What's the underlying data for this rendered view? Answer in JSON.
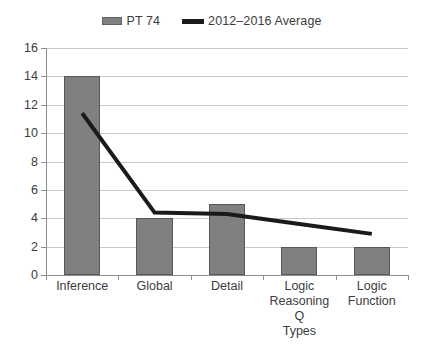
{
  "chart_data": {
    "type": "bar",
    "title": "",
    "subtitle": "",
    "xlabel": "",
    "ylabel": "",
    "categories": [
      "Inference",
      "Global",
      "Detail",
      "Logic Reasoning Q Types",
      "Logic Function"
    ],
    "ylim": [
      0,
      16
    ],
    "ytick_step": 2,
    "yticks": [
      16,
      14,
      12,
      10,
      8,
      6,
      4,
      2,
      0
    ],
    "grid": true,
    "legend_position": "top-center",
    "series": [
      {
        "name": "PT 74",
        "type": "bar",
        "color": "#808080",
        "values": [
          14,
          4,
          5,
          2,
          2
        ]
      },
      {
        "name": "2012–2016 Average",
        "type": "line",
        "color": "#1a1a1a",
        "values": [
          11.4,
          4.4,
          4.3,
          3.6,
          2.9
        ]
      }
    ]
  },
  "legend": {
    "entries": [
      {
        "label": "PT 74",
        "swatch": "bar-swatch",
        "color": "#808080"
      },
      {
        "label": "2012–2016 Average",
        "swatch": "line-swatch",
        "color": "#1a1a1a"
      }
    ]
  },
  "axes": {
    "y": {
      "ticks": [
        "16",
        "14",
        "12",
        "10",
        "8",
        "6",
        "4",
        "2",
        "0"
      ],
      "min": 0,
      "max": 16
    },
    "x": {
      "ticks": [
        {
          "lines": [
            "Inference"
          ]
        },
        {
          "lines": [
            "Global"
          ]
        },
        {
          "lines": [
            "Detail"
          ]
        },
        {
          "lines": [
            "Logic",
            "Reasoning Q",
            "Types"
          ]
        },
        {
          "lines": [
            "Logic",
            "Function"
          ]
        }
      ]
    }
  }
}
